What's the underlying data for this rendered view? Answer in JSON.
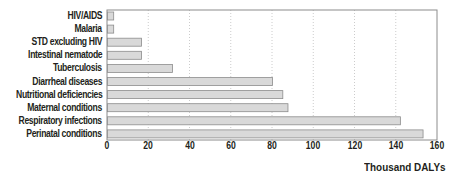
{
  "chart_data": {
    "type": "bar",
    "orientation": "horizontal",
    "title": "",
    "xlabel": "Thousand DALYs",
    "ylabel": "",
    "categories": [
      "HIV/AIDS",
      "Malaria",
      "STD excluding HIV",
      "Intestinal nematode",
      "Tuberculosis",
      "Diarrheal diseases",
      "Nutritional deficiencies",
      "Maternal conditions",
      "Respiratory infections",
      "Perinatal conditions"
    ],
    "values": [
      3,
      3,
      16.5,
      16.5,
      31.5,
      80,
      85,
      87.5,
      142,
      153
    ],
    "xlim": [
      0,
      160
    ],
    "xticks": [
      0,
      20,
      40,
      60,
      80,
      100,
      120,
      140,
      160
    ],
    "grid": "vertical dotted",
    "legend": null,
    "colors": {
      "bar_fill": "#d9d9d9",
      "bar_stroke": "#8c8c8c",
      "frame": "#8c8c8c",
      "grid": "#bfbfbf",
      "text": "#231f20"
    }
  }
}
